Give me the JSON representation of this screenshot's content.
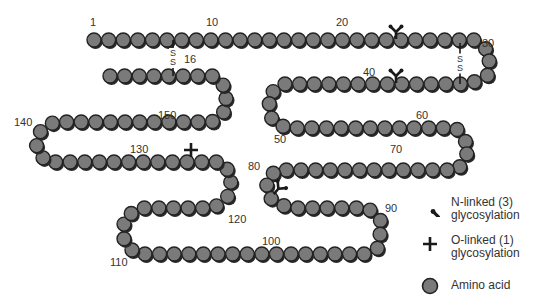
{
  "colors": {
    "bead_fill": "#7a7a7a",
    "bead_stroke": "#222222",
    "bead_shadow": "#2a2a2a",
    "glyco_mark": "#1a1a1a",
    "label_text": "#333333"
  },
  "chain": {
    "residue_count": 155,
    "bead_radius": 7,
    "path": [
      [
        94,
        40
      ],
      [
        474,
        40
      ],
      [
        490,
        52
      ],
      [
        488,
        75
      ],
      [
        470,
        84
      ],
      [
        282,
        84
      ],
      [
        268,
        96
      ],
      [
        272,
        120
      ],
      [
        286,
        128
      ],
      [
        456,
        128
      ],
      [
        470,
        148
      ],
      [
        458,
        170
      ],
      [
        276,
        170
      ],
      [
        266,
        182
      ],
      [
        270,
        198
      ],
      [
        288,
        208
      ],
      [
        368,
        208
      ],
      [
        382,
        222
      ],
      [
        378,
        248
      ],
      [
        366,
        254
      ],
      [
        136,
        254
      ],
      [
        124,
        242
      ],
      [
        124,
        218
      ],
      [
        140,
        208
      ],
      [
        214,
        208
      ],
      [
        228,
        196
      ],
      [
        232,
        176
      ],
      [
        222,
        162
      ],
      [
        46,
        162
      ],
      [
        36,
        148
      ],
      [
        40,
        132
      ],
      [
        54,
        122
      ],
      [
        212,
        122
      ],
      [
        226,
        110
      ],
      [
        226,
        88
      ],
      [
        214,
        76
      ],
      [
        110,
        76
      ]
    ]
  },
  "residue_labels": [
    {
      "text": "1",
      "x": 90,
      "y": 26
    },
    {
      "text": "10",
      "x": 206,
      "y": 26
    },
    {
      "text": "16",
      "x": 184,
      "y": 63
    },
    {
      "text": "20",
      "x": 336,
      "y": 26
    },
    {
      "text": "30",
      "x": 482,
      "y": 47
    },
    {
      "text": "40",
      "x": 363,
      "y": 76
    },
    {
      "text": "50",
      "x": 274,
      "y": 143
    },
    {
      "text": "60",
      "x": 416,
      "y": 119
    },
    {
      "text": "70",
      "x": 390,
      "y": 153
    },
    {
      "text": "80",
      "x": 248,
      "y": 170
    },
    {
      "text": "90",
      "x": 385,
      "y": 212
    },
    {
      "text": "100",
      "x": 262,
      "y": 245
    },
    {
      "text": "110",
      "x": 110,
      "y": 266
    },
    {
      "text": "120",
      "x": 228,
      "y": 223
    },
    {
      "text": "130",
      "x": 130,
      "y": 153
    },
    {
      "text": "140",
      "x": 14,
      "y": 126
    },
    {
      "text": "150",
      "x": 158,
      "y": 119
    }
  ],
  "disulfide_bonds": [
    {
      "label": "S\nS",
      "x": 173,
      "y1": 40,
      "y2": 76
    },
    {
      "label": "S\nS",
      "x": 460,
      "y1": 43,
      "y2": 84
    }
  ],
  "n_linked_sites": [
    {
      "x": 396,
      "y": 31
    },
    {
      "x": 396,
      "y": 75
    },
    {
      "x": 279,
      "y": 188,
      "rotate": 40
    }
  ],
  "o_linked_sites": [
    {
      "x": 191,
      "y": 150
    }
  ],
  "legend": {
    "items": [
      {
        "icon": "n-linked-glycosylation-icon",
        "label": "N-linked (3)\nglycosylation"
      },
      {
        "icon": "o-linked-glycosylation-icon",
        "label": "O-linked (1)\nglycosylation"
      },
      {
        "icon": "amino-acid-icon",
        "label": "Amino acid"
      }
    ]
  }
}
